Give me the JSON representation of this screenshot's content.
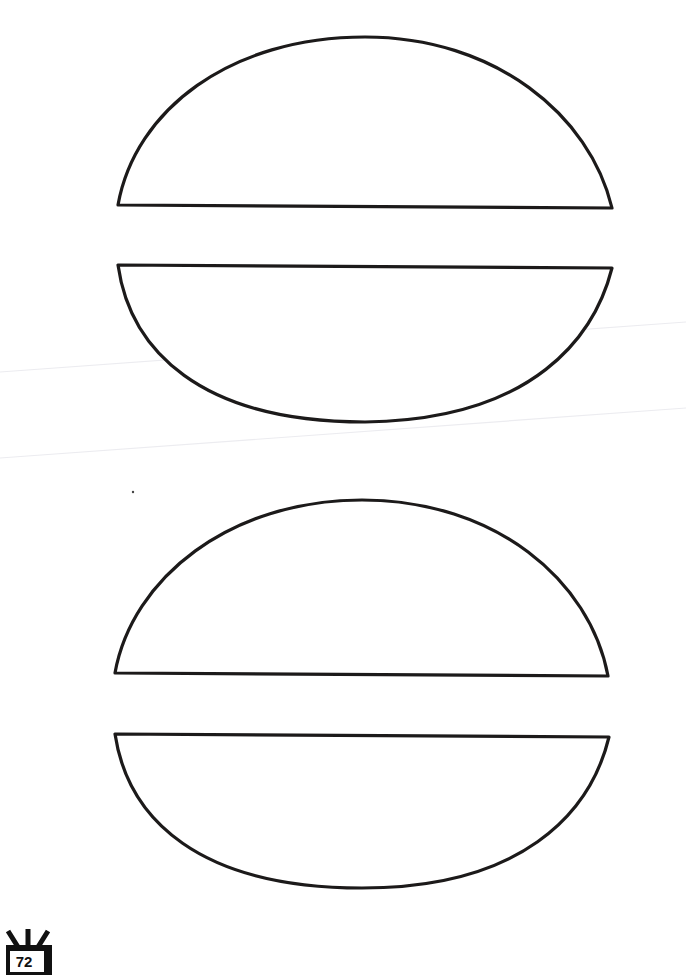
{
  "page": {
    "type": "printable template sheet",
    "shapes": [
      {
        "name": "burger-top-bun-1",
        "kind": "top-half-oval"
      },
      {
        "name": "burger-bottom-bun-1",
        "kind": "bottom-half-oval"
      },
      {
        "name": "burger-top-bun-2",
        "kind": "top-half-oval"
      },
      {
        "name": "burger-bottom-bun-2",
        "kind": "bottom-half-oval"
      }
    ],
    "stroke_color": "#1c1a1a",
    "background_color": "#ffffff"
  },
  "footer": {
    "page_number": "72",
    "badge_icon": "tv-badge-icon"
  }
}
